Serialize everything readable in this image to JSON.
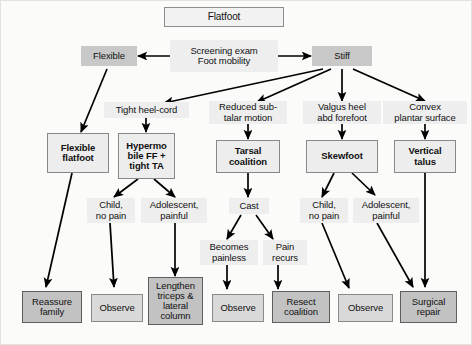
{
  "diagram": {
    "title": "Flatfoot",
    "background_color": "#fbfbfa",
    "chip_color": "#c8c8c8",
    "treatment_color": "#c2c2c2",
    "arrow_color": "#000000",
    "nodes": {
      "flatfoot": "Flatfoot",
      "screening": "Screening exam\nFoot mobility",
      "flexible": "Flexible",
      "stiff": "Stiff",
      "tight_heel_cord": "Tight heel-cord",
      "reduced_subtalar": "Reduced sub-\ntalar motion",
      "valgus_heel": "Valgus heel\nabd forefoot",
      "convex_plantar": "Convex\nplantar surface",
      "flexible_flatfoot": "Flexible\nflatfoot",
      "hypermobile": "Hypermo\nbile FF +\ntight TA",
      "tarsal_coalition": "Tarsal\ncoalition",
      "skewfoot": "Skewfoot",
      "vertical_talus": "Vertical\ntalus",
      "child_no_pain_1": "Child,\nno pain",
      "adolescent_painful_1": "Adolescent,\npainful",
      "cast": "Cast",
      "child_no_pain_2": "Child,\nno pain",
      "adolescent_painful_2": "Adolescent,\npainful",
      "becomes_painless": "Becomes\npainless",
      "pain_recurs": "Pain\nrecurs",
      "reassure_family": "Reassure\nfamily",
      "observe_1": "Observe",
      "lengthen": "Lengthen\ntriceps &\nlateral\ncolumn",
      "observe_2": "Observe",
      "resect_coalition": "Resect\ncoalition",
      "observe_3": "Observe",
      "surgical_repair": "Surgical\nrepair"
    }
  }
}
